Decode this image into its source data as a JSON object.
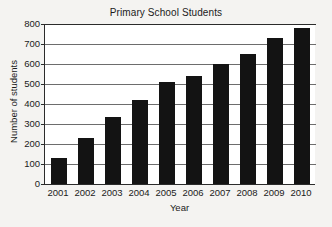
{
  "chart_data": {
    "type": "bar",
    "title": "Primary School Students",
    "xlabel": "Year",
    "ylabel": "Number of students",
    "categories": [
      "2001",
      "2002",
      "2003",
      "2004",
      "2005",
      "2006",
      "2007",
      "2008",
      "2009",
      "2010"
    ],
    "values": [
      130,
      230,
      335,
      420,
      510,
      540,
      600,
      650,
      730,
      780
    ],
    "ylim": [
      0,
      800
    ],
    "yticks": [
      0,
      100,
      200,
      300,
      400,
      500,
      600,
      700,
      800
    ],
    "ytick_labels": [
      "0",
      "100",
      "200",
      "300",
      "400",
      "500",
      "600",
      "700",
      "800"
    ],
    "grid": true,
    "legend": false,
    "bar_color": "#131313",
    "plot_background": "#ffffff",
    "figure_background": "#f4f3f1",
    "axis_color": "#2b2b2b",
    "grid_color": "#6d6d6d"
  }
}
